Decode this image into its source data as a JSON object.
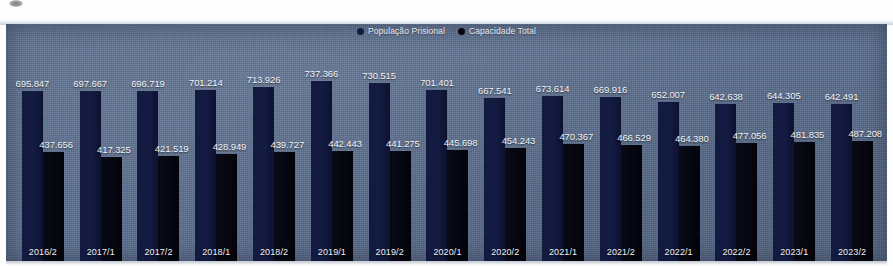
{
  "chart_data": {
    "type": "bar",
    "title": "",
    "xlabel": "",
    "ylabel": "",
    "grid": false,
    "legend_position": "top-center",
    "ylim": [
      0,
      800000
    ],
    "categories": [
      "2016/2",
      "2017/1",
      "2017/2",
      "2018/1",
      "2018/2",
      "2019/1",
      "2019/2",
      "2020/1",
      "2020/2",
      "2021/1",
      "2021/2",
      "2022/1",
      "2022/2",
      "2023/1",
      "2023/2"
    ],
    "series": [
      {
        "name": "População Prisional",
        "color": "#141b42",
        "values": [
          695847,
          697667,
          696719,
          701214,
          713926,
          737366,
          730515,
          701401,
          667541,
          673614,
          669916,
          652007,
          642638,
          644305,
          642491
        ],
        "labels": [
          "695.847",
          "697.667",
          "696.719",
          "701.214",
          "713.926",
          "737.366",
          "730.515",
          "701.401",
          "667.541",
          "673.614",
          "669.916",
          "652.007",
          "642.638",
          "644.305",
          "642.491"
        ]
      },
      {
        "name": "Capacidade Total",
        "color": "#05060f",
        "values": [
          437656,
          417325,
          421519,
          428949,
          439727,
          442443,
          441275,
          445698,
          454243,
          470367,
          466529,
          464380,
          477056,
          481835,
          487208
        ],
        "labels": [
          "437.656",
          "417.325",
          "421.519",
          "428.949",
          "439.727",
          "442.443",
          "441.275",
          "445.698",
          "454.243",
          "470.367",
          "466.529",
          "464.380",
          "477.056",
          "481.835",
          "487.208"
        ]
      }
    ]
  },
  "legend": {
    "items": [
      {
        "label": "População Prisional",
        "color": "#141b42"
      },
      {
        "label": "Capacidade Total",
        "color": "#05060f"
      }
    ]
  },
  "colors": {
    "panel_background": "#5d7090",
    "population_bar": "#141b42",
    "capacity_bar": "#05060f",
    "label_text": "#f2f5fa"
  }
}
